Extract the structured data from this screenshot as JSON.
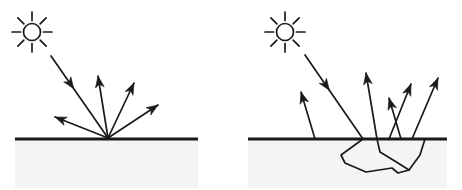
{
  "figure": {
    "width": 462,
    "height": 190,
    "background_color": "#ffffff",
    "stroke_color": "#1a1a1a",
    "subsurface_fill_color": "#f4f4f4",
    "ground_line_color": "#1a1a1a",
    "ground_line_width": 3,
    "ray_line_width": 1.7
  },
  "panels": [
    {
      "id": "left-panel",
      "name": "specular-diffuse-surface-reflection",
      "label": "",
      "sun": {
        "name": "sun-icon",
        "center_x": 32,
        "center_y": 32,
        "radius": 8.5,
        "ray_inner": 11.5,
        "ray_outer": 20,
        "ray_count": 8
      },
      "ground": {
        "name": "ground-line",
        "x1": 15,
        "y1": 139,
        "x2": 198,
        "y2": 139
      },
      "subsurface_region": {
        "name": "subsurface-fill",
        "x": 15,
        "y": 140,
        "width": 183,
        "height": 48
      },
      "hit_point": {
        "x": 108,
        "y": 138
      },
      "incoming_rays": [
        {
          "name": "incoming-sun-ray",
          "x1": 51,
          "y1": 56,
          "x2": 108,
          "y2": 138,
          "arrow_at": 0.4,
          "direction": "inward"
        }
      ],
      "outgoing_rays": [
        {
          "name": "outgoing-ray-1",
          "x1": 108,
          "y1": 138,
          "x2": 55,
          "y2": 117,
          "direction": "outward"
        },
        {
          "name": "outgoing-ray-2",
          "x1": 108,
          "y1": 138,
          "x2": 98,
          "y2": 76,
          "direction": "outward"
        },
        {
          "name": "outgoing-ray-3",
          "x1": 108,
          "y1": 138,
          "x2": 134,
          "y2": 83,
          "direction": "outward"
        },
        {
          "name": "outgoing-ray-4",
          "x1": 108,
          "y1": 138,
          "x2": 158,
          "y2": 105,
          "direction": "outward"
        }
      ],
      "subsurface_path": []
    },
    {
      "id": "right-panel",
      "name": "subsurface-scattering",
      "label": "",
      "sun": {
        "name": "sun-icon",
        "center_x": 285,
        "center_y": 32,
        "radius": 8.5,
        "ray_inner": 11.5,
        "ray_outer": 20,
        "ray_count": 8
      },
      "ground": {
        "name": "ground-line",
        "x1": 248,
        "y1": 139,
        "x2": 447,
        "y2": 139
      },
      "subsurface_region": {
        "name": "subsurface-fill",
        "x": 248,
        "y": 140,
        "width": 199,
        "height": 48
      },
      "hit_point": {
        "x": 363,
        "y": 139
      },
      "incoming_rays": [
        {
          "name": "incoming-sun-ray",
          "x1": 305,
          "y1": 55,
          "x2": 363,
          "y2": 139,
          "arrow_at": 0.42,
          "direction": "inward"
        }
      ],
      "outgoing_rays": [
        {
          "name": "outgoing-ray-1",
          "x1": 315,
          "y1": 139,
          "x2": 301,
          "y2": 92,
          "direction": "outward"
        },
        {
          "name": "outgoing-ray-2",
          "x1": 377,
          "y1": 139,
          "x2": 366,
          "y2": 73,
          "direction": "outward"
        },
        {
          "name": "outgoing-ray-3",
          "x1": 401,
          "y1": 139,
          "x2": 389,
          "y2": 98,
          "direction": "outward"
        },
        {
          "name": "outgoing-ray-4",
          "x1": 389,
          "y1": 139,
          "x2": 411,
          "y2": 84,
          "direction": "outward"
        },
        {
          "name": "outgoing-ray-5",
          "x1": 412,
          "y1": 139,
          "x2": 438,
          "y2": 78,
          "direction": "outward"
        }
      ],
      "subsurface_path": {
        "name": "subsurface-scatter-path",
        "points": [
          [
            363,
            139
          ],
          [
            341,
            155
          ],
          [
            345,
            163
          ],
          [
            366,
            172
          ],
          [
            392,
            168
          ],
          [
            398,
            173
          ],
          [
            409,
            170
          ],
          [
            420,
            155
          ],
          [
            425,
            139
          ]
        ],
        "branch": {
          "name": "subsurface-branch",
          "points": [
            [
              377,
              139
            ],
            [
              380,
              152
            ],
            [
              398,
              163
            ],
            [
              409,
              170
            ]
          ]
        }
      }
    }
  ]
}
